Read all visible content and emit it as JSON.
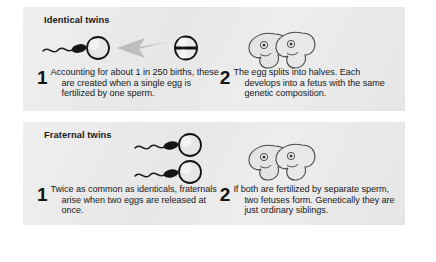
{
  "figure": {
    "background_color": "#ffffff",
    "panel_color": "#ebebeb",
    "text_color": "#17191b",
    "arrow_color": "#b6b6b6"
  },
  "sections": [
    {
      "id": "identical-twins",
      "heading": "Identical twins",
      "illustration_left": {
        "name": "sperm-egg-splitting-egg-diagram",
        "elements": [
          "sperm",
          "egg",
          "arrow",
          "split-egg"
        ]
      },
      "illustration_right": {
        "name": "identical-fetuses-diagram",
        "elements": [
          "fetus",
          "fetus"
        ]
      },
      "steps": [
        {
          "number": "1",
          "text": "Accounting for about 1 in 250 births, these are created when a single egg is fertilized by one sperm."
        },
        {
          "number": "2",
          "text": "The egg splits into halves. Each develops into a fetus with the same genetic composition."
        }
      ]
    },
    {
      "id": "fraternal-twins",
      "heading": "Fraternal twins",
      "illustration_left": {
        "name": "two-sperm-two-eggs-diagram",
        "elements": [
          "sperm",
          "egg",
          "sperm",
          "egg"
        ]
      },
      "illustration_right": {
        "name": "fraternal-fetuses-diagram",
        "elements": [
          "fetus",
          "fetus"
        ]
      },
      "steps": [
        {
          "number": "1",
          "text": "Twice as common as identicals, fraternals arise when two eggs are released at once."
        },
        {
          "number": "2",
          "text": "If both are fertilized by separate sperm, two fetuses form. Genetically they are just ordinary siblings."
        }
      ]
    }
  ]
}
